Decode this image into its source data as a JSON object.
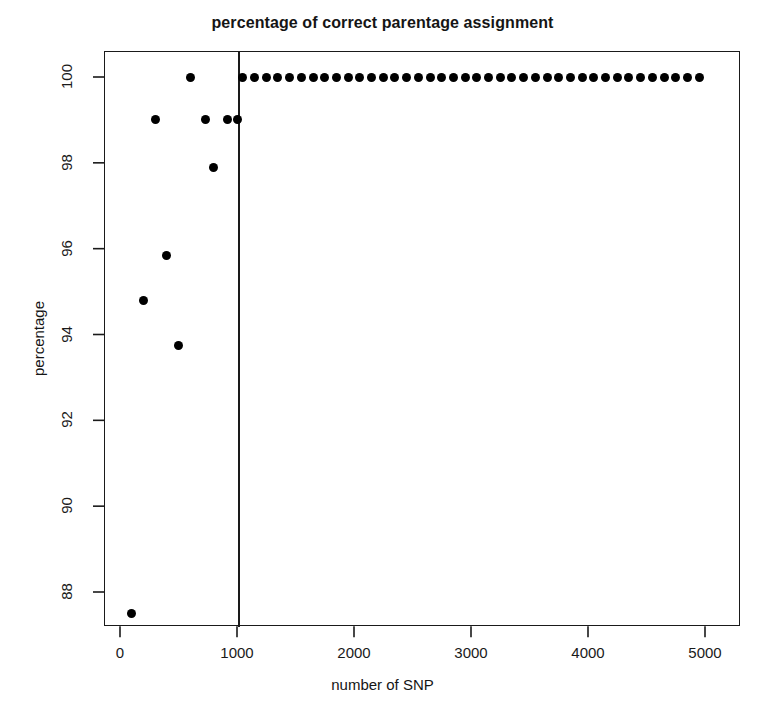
{
  "figure": {
    "width": 765,
    "height": 723,
    "background": "#ffffff",
    "marker_color": "#000000",
    "axis_color": "#1a1a1a"
  },
  "chart_data": {
    "type": "scatter",
    "title": "percentage of correct parentage assignment",
    "xlabel": "number of SNP",
    "ylabel": "percentage",
    "xlim": [
      0,
      5200
    ],
    "ylim": [
      87.2,
      100.6
    ],
    "xticks": [
      0,
      1000,
      2000,
      3000,
      4000,
      5000
    ],
    "xtick_labels": [
      "0",
      "1000",
      "2000",
      "3000",
      "4000",
      "5000"
    ],
    "yticks": [
      88,
      90,
      92,
      94,
      96,
      98,
      100
    ],
    "ytick_labels": [
      "88",
      "90",
      "92",
      "94",
      "96",
      "98",
      "100"
    ],
    "grid": false,
    "legend": null,
    "annotations": [
      {
        "type": "vertical-line",
        "x": 1000,
        "label": "reference line at 1000 SNP"
      }
    ],
    "series": [
      {
        "name": "percentage of correct parentage assignment",
        "marker": "filled-circle",
        "color": "#000000",
        "points": [
          {
            "x": 100,
            "y": 87.5
          },
          {
            "x": 200,
            "y": 94.8
          },
          {
            "x": 300,
            "y": 99.0
          },
          {
            "x": 400,
            "y": 95.85
          },
          {
            "x": 500,
            "y": 93.75
          },
          {
            "x": 600,
            "y": 100.0
          },
          {
            "x": 730,
            "y": 99.0
          },
          {
            "x": 800,
            "y": 97.9
          },
          {
            "x": 920,
            "y": 99.0
          },
          {
            "x": 1000,
            "y": 99.0
          },
          {
            "x": 1050,
            "y": 100.0
          },
          {
            "x": 1150,
            "y": 100.0
          },
          {
            "x": 1250,
            "y": 100.0
          },
          {
            "x": 1350,
            "y": 100.0
          },
          {
            "x": 1450,
            "y": 100.0
          },
          {
            "x": 1550,
            "y": 100.0
          },
          {
            "x": 1650,
            "y": 100.0
          },
          {
            "x": 1750,
            "y": 100.0
          },
          {
            "x": 1850,
            "y": 100.0
          },
          {
            "x": 1950,
            "y": 100.0
          },
          {
            "x": 2050,
            "y": 100.0
          },
          {
            "x": 2150,
            "y": 100.0
          },
          {
            "x": 2250,
            "y": 100.0
          },
          {
            "x": 2350,
            "y": 100.0
          },
          {
            "x": 2450,
            "y": 100.0
          },
          {
            "x": 2550,
            "y": 100.0
          },
          {
            "x": 2650,
            "y": 100.0
          },
          {
            "x": 2750,
            "y": 100.0
          },
          {
            "x": 2850,
            "y": 100.0
          },
          {
            "x": 2950,
            "y": 100.0
          },
          {
            "x": 3050,
            "y": 100.0
          },
          {
            "x": 3150,
            "y": 100.0
          },
          {
            "x": 3250,
            "y": 100.0
          },
          {
            "x": 3350,
            "y": 100.0
          },
          {
            "x": 3450,
            "y": 100.0
          },
          {
            "x": 3550,
            "y": 100.0
          },
          {
            "x": 3650,
            "y": 100.0
          },
          {
            "x": 3750,
            "y": 100.0
          },
          {
            "x": 3850,
            "y": 100.0
          },
          {
            "x": 3950,
            "y": 100.0
          },
          {
            "x": 4050,
            "y": 100.0
          },
          {
            "x": 4150,
            "y": 100.0
          },
          {
            "x": 4250,
            "y": 100.0
          },
          {
            "x": 4350,
            "y": 100.0
          },
          {
            "x": 4450,
            "y": 100.0
          },
          {
            "x": 4550,
            "y": 100.0
          },
          {
            "x": 4650,
            "y": 100.0
          },
          {
            "x": 4750,
            "y": 100.0
          },
          {
            "x": 4850,
            "y": 100.0
          },
          {
            "x": 4950,
            "y": 100.0
          }
        ]
      }
    ]
  }
}
